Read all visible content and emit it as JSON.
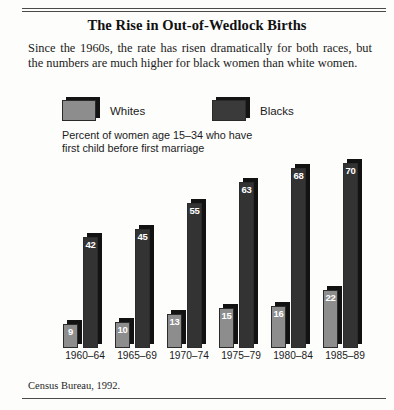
{
  "title": "The Rise in Out-of-Wedlock Births",
  "subtitle": "Since the 1960s, the rate has risen dramatically for both races, but the numbers are much higher for black women than white women.",
  "axis_note": "Percent of women age 15–34 who have\nfirst child before first marriage",
  "source": "Census Bureau, 1992.",
  "legend": {
    "whites_label": "Whites",
    "blacks_label": "Blacks",
    "whites_color": "#8d8d8d",
    "blacks_color": "#333333"
  },
  "chart_data": {
    "type": "bar",
    "title": "The Rise in Out-of-Wedlock Births",
    "subtitle": "Since the 1960s, the rate has risen dramatically for both races, but the numbers are much higher for black women than white women.",
    "xlabel": "",
    "ylabel": "Percent of women age 15–34 who have first child before first marriage",
    "ylim": [
      0,
      75
    ],
    "grid": false,
    "legend_position": "top-left",
    "source": "Census Bureau, 1992.",
    "categories": [
      "1960–64",
      "1965–69",
      "1970–74",
      "1975–79",
      "1980–84",
      "1985–89"
    ],
    "series": [
      {
        "name": "Whites",
        "color": "#8d8d8d",
        "values": [
          9,
          10,
          13,
          15,
          16,
          22
        ]
      },
      {
        "name": "Blacks",
        "color": "#333333",
        "values": [
          42,
          45,
          55,
          63,
          68,
          70
        ]
      }
    ]
  }
}
